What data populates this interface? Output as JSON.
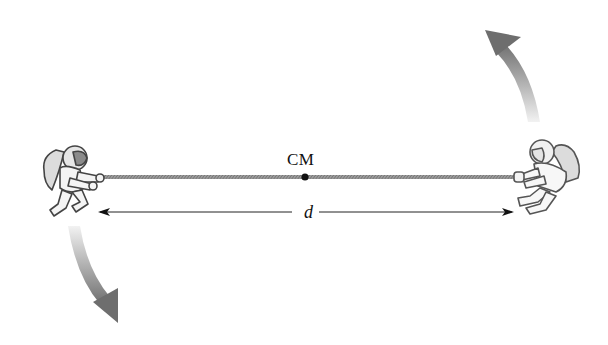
{
  "diagram": {
    "cm_label": "CM",
    "distance_label": "d",
    "elements": {
      "left_astronaut": "astronaut pulling rope, left end",
      "right_astronaut": "astronaut pulling rope, right end",
      "rope": "taut rope connecting astronauts",
      "center_of_mass": "black dot at rope midpoint",
      "distance_arrow": "double-headed dimension arrow",
      "rotation_arrows": [
        "curved arrow at top right pointing up",
        "curved arrow at bottom left pointing down"
      ]
    },
    "colors": {
      "rope": "#8a8a8a",
      "arrow_dark": "#6e6e6e",
      "arrow_light": "#e6e6e6",
      "ink": "#111111"
    }
  }
}
